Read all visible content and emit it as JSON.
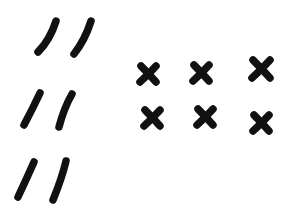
{
  "canvas": {
    "width": 289,
    "height": 221,
    "background": "#ffffff",
    "ink_color": "#111111"
  },
  "tally_groups": [
    {
      "label": "double-slash-row-1",
      "strokes": [
        {
          "x1": 56,
          "y1": 21,
          "x2": 38,
          "y2": 52,
          "cx": 50,
          "cy": 40
        },
        {
          "x1": 91,
          "y1": 21,
          "x2": 74,
          "y2": 54,
          "cx": 85,
          "cy": 40
        }
      ]
    },
    {
      "label": "double-slash-row-2",
      "strokes": [
        {
          "x1": 40,
          "y1": 93,
          "x2": 24,
          "y2": 125,
          "cx": 33,
          "cy": 108
        },
        {
          "x1": 72,
          "y1": 94,
          "x2": 59,
          "y2": 127,
          "cx": 64,
          "cy": 108
        }
      ]
    },
    {
      "label": "double-slash-row-3",
      "strokes": [
        {
          "x1": 34,
          "y1": 162,
          "x2": 18,
          "y2": 197,
          "cx": 26,
          "cy": 180
        },
        {
          "x1": 66,
          "y1": 161,
          "x2": 53,
          "y2": 200,
          "cx": 62,
          "cy": 178
        }
      ]
    }
  ],
  "x_marks": [
    {
      "row": 1,
      "col": 1,
      "cx": 148,
      "cy": 74,
      "size": 8
    },
    {
      "row": 1,
      "col": 2,
      "cx": 201,
      "cy": 73,
      "size": 8
    },
    {
      "row": 1,
      "col": 3,
      "cx": 261,
      "cy": 69,
      "size": 9
    },
    {
      "row": 2,
      "col": 1,
      "cx": 152,
      "cy": 118,
      "size": 8
    },
    {
      "row": 2,
      "col": 2,
      "cx": 205,
      "cy": 117,
      "size": 8
    },
    {
      "row": 2,
      "col": 3,
      "cx": 261,
      "cy": 123,
      "size": 8
    }
  ]
}
